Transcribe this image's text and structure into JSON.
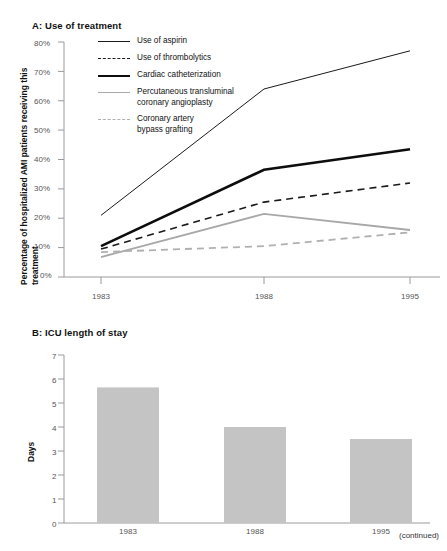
{
  "figure": {
    "continued_note": "(continued)"
  },
  "panelA": {
    "title": "A: Use of treatment",
    "ylabel": "Percentage of hospitalized AMI patients receiving this treatment",
    "legend": [
      {
        "key": "aspirin",
        "label": "Use of aspirin"
      },
      {
        "key": "thrombolytics",
        "label": "Use of thrombolytics"
      },
      {
        "key": "catheterization",
        "label": "Cardiac catheterization"
      },
      {
        "key": "ptca",
        "label": "Percutaneous transluminal\ncoronary angioplasty"
      },
      {
        "key": "cabg",
        "label": "Coronary artery\nbypass grafting"
      }
    ],
    "ytick_labels": [
      "80%",
      "70%",
      "60%",
      "50%",
      "40%",
      "30%",
      "20%",
      "10%",
      "0%"
    ],
    "xtick_labels": [
      "1983",
      "1988",
      "1995"
    ]
  },
  "panelB": {
    "title": "B: ICU length of stay",
    "ylabel": "Days",
    "ytick_labels": [
      "7",
      "6",
      "5",
      "4",
      "3",
      "2",
      "1",
      "0"
    ],
    "xtick_labels": [
      "1983",
      "1988",
      "1995"
    ]
  },
  "chart_data": [
    {
      "type": "line",
      "title": "A: Use of treatment",
      "xlabel": "",
      "ylabel": "Percentage of hospitalized AMI patients receiving this treatment",
      "categories": [
        "1983",
        "1988",
        "1995"
      ],
      "x": [
        1983,
        1988,
        1995
      ],
      "ylim": [
        0,
        80
      ],
      "yticks": [
        0,
        10,
        20,
        30,
        40,
        50,
        60,
        70,
        80
      ],
      "ytickformat": "percent",
      "grid": false,
      "legend_position": "upper-left-inside",
      "series": [
        {
          "name": "Use of aspirin",
          "values": [
            21,
            64,
            77
          ],
          "style": "solid",
          "color": "#1a1a1a",
          "width": 1.0
        },
        {
          "name": "Use of thrombolytics",
          "values": [
            9.5,
            25.5,
            32
          ],
          "style": "dashed",
          "color": "#1a1a1a",
          "width": 1.6
        },
        {
          "name": "Cardiac catheterization",
          "values": [
            10.5,
            36.5,
            43.5
          ],
          "style": "solid",
          "color": "#0d0d0d",
          "width": 2.6
        },
        {
          "name": "Percutaneous transluminal coronary angioplasty",
          "values": [
            6.8,
            21.5,
            16
          ],
          "style": "solid",
          "color": "#a8a8a8",
          "width": 1.8
        },
        {
          "name": "Coronary artery bypass grafting",
          "values": [
            8.5,
            10.5,
            15.2
          ],
          "style": "dashed",
          "color": "#b0b0b0",
          "width": 1.8
        }
      ]
    },
    {
      "type": "bar",
      "title": "B: ICU length of stay",
      "xlabel": "",
      "ylabel": "Days",
      "categories": [
        "1983",
        "1988",
        "1995"
      ],
      "values": [
        5.65,
        4.0,
        3.5
      ],
      "ylim": [
        0,
        7
      ],
      "yticks": [
        0,
        1,
        2,
        3,
        4,
        5,
        6,
        7
      ],
      "grid": false,
      "bar_color": "#c4c4c4"
    }
  ]
}
